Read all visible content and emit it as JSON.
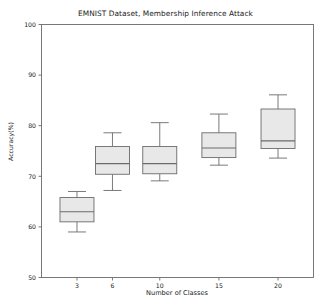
{
  "chart_data": {
    "type": "box",
    "title": "EMNIST Dataset, Membership Inference Attack",
    "xlabel": "Number of Classes",
    "ylabel": "Accuracy(%)",
    "xlim": [
      0,
      23
    ],
    "ylim": [
      50,
      100
    ],
    "yticks": [
      50,
      60,
      70,
      80,
      90,
      100
    ],
    "ytick_labels": [
      "50",
      "60",
      "70",
      "80",
      "90",
      "100"
    ],
    "xticks": [
      3,
      6,
      10,
      15,
      20
    ],
    "xtick_labels": [
      "3",
      "6",
      "10",
      "15",
      "20"
    ],
    "grid": false,
    "legend": null,
    "categories": [
      "3",
      "6",
      "10",
      "15",
      "20"
    ],
    "boxes": [
      {
        "category": "3",
        "x": 3,
        "whisker_low": 59.0,
        "q1": 61.0,
        "median": 63.0,
        "q3": 65.8,
        "whisker_high": 67.0
      },
      {
        "category": "6",
        "x": 6,
        "whisker_low": 67.2,
        "q1": 70.4,
        "median": 72.5,
        "q3": 75.9,
        "whisker_high": 78.6
      },
      {
        "category": "10",
        "x": 10,
        "whisker_low": 69.1,
        "q1": 70.5,
        "median": 72.5,
        "q3": 75.9,
        "whisker_high": 80.6
      },
      {
        "category": "15",
        "x": 15,
        "whisker_low": 72.2,
        "q1": 73.7,
        "median": 75.6,
        "q3": 78.6,
        "whisker_high": 82.3
      },
      {
        "category": "20",
        "x": 20,
        "whisker_low": 73.6,
        "q1": 75.5,
        "median": 77.0,
        "q3": 83.3,
        "whisker_high": 86.1
      }
    ],
    "style": {
      "box_fill": "#e8e8e8",
      "box_edge": "#6b6b6b",
      "median_color": "#6b6b6b",
      "whisker_color": "#6b6b6b",
      "cap_color": "#6b6b6b",
      "axis_color": "#6b6b6b",
      "text_color": "#1a1a1a",
      "background": "#ffffff"
    }
  }
}
